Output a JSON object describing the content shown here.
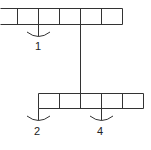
{
  "diagram": {
    "type": "linked-array-structure",
    "stroke_color": "#333333",
    "top_row": {
      "cells": 6,
      "x_edges": [
        0,
        17,
        38,
        59,
        80,
        101,
        122
      ],
      "y_top": 8,
      "y_bottom": 24
    },
    "bottom_row": {
      "cells": 5,
      "x_edges": [
        38,
        59,
        80,
        101,
        122,
        143
      ],
      "y_top": 93,
      "y_bottom": 108
    },
    "connector": {
      "x": 80,
      "y_from": 24,
      "y_to": 93
    },
    "pointers": [
      {
        "label": "1",
        "x": 38,
        "y_from": 24,
        "arc_y": 36
      },
      {
        "label": "2",
        "x": 38,
        "y_from": 108,
        "arc_y": 120
      },
      {
        "label": "4",
        "x": 101,
        "y_from": 108,
        "arc_y": 120
      }
    ]
  }
}
